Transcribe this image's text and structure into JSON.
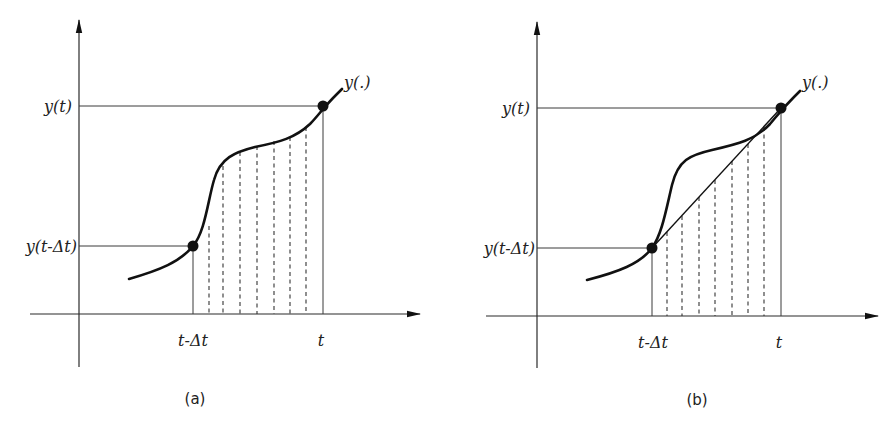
{
  "panels": [
    {
      "id": "a",
      "caption": "(a)",
      "curve_label": "y(.)",
      "y_labels": {
        "upper": "y(t)",
        "lower": "y(t-Δt)"
      },
      "x_labels": {
        "left": "t-Δt",
        "right": "t"
      },
      "dashed_lines": 7,
      "description": "Curve y(.) between t-Δt and t, area under curve subdivided by dashed vertical lines"
    },
    {
      "id": "b",
      "caption": "(b)",
      "curve_label": "y(.)",
      "y_labels": {
        "upper": "y(t)",
        "lower": "y(t-Δt)"
      },
      "x_labels": {
        "left": "t-Δt",
        "right": "t"
      },
      "dashed_lines": 7,
      "description": "Curve y(.) with straight chord from (t-Δt, y(t-Δt)) to (t, y(t)); dashed vertical lines under the chord"
    }
  ],
  "colors": {
    "ink": "#111111",
    "background": "#ffffff"
  }
}
